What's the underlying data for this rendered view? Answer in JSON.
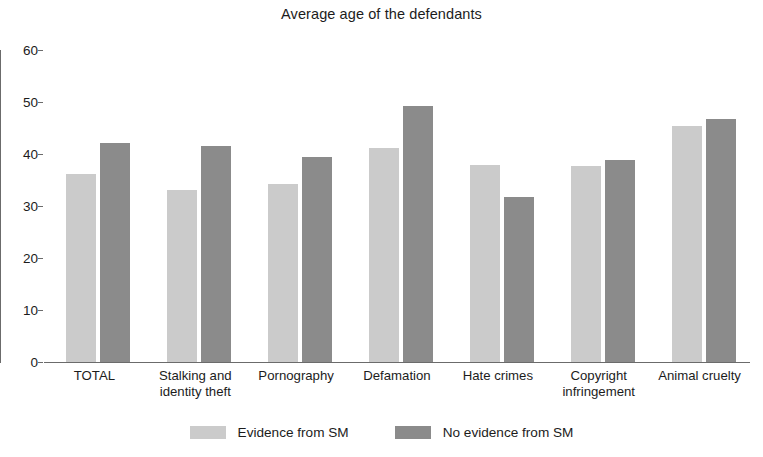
{
  "chart_data": {
    "type": "bar",
    "title": "Average age of the defendants",
    "xlabel": "",
    "ylabel": "",
    "ylim": [
      0,
      60
    ],
    "yticks": [
      0,
      10,
      20,
      30,
      40,
      50,
      60
    ],
    "grid": false,
    "legend_position": "bottom",
    "categories": [
      "TOTAL",
      "Stalking and\nidentity theft",
      "Pornography",
      "Defamation",
      "Hate crimes",
      "Copyright\ninfringement",
      "Animal cruelty"
    ],
    "series": [
      {
        "name": "Evidence from SM",
        "color": "#cbcbcb",
        "values": [
          36.2,
          33.1,
          34.2,
          41.1,
          37.9,
          37.6,
          45.3
        ]
      },
      {
        "name": "No evidence from SM",
        "color": "#8b8b8b",
        "values": [
          42.2,
          41.5,
          39.4,
          49.2,
          31.8,
          38.9,
          46.7
        ]
      }
    ]
  },
  "axis": {
    "tick_labels": [
      "60",
      "50",
      "40",
      "30",
      "20",
      "10",
      "0"
    ]
  },
  "legend": {
    "items": [
      {
        "label": "Evidence from SM",
        "swatch": "light"
      },
      {
        "label": "No evidence from SM",
        "swatch": "dark"
      }
    ]
  }
}
